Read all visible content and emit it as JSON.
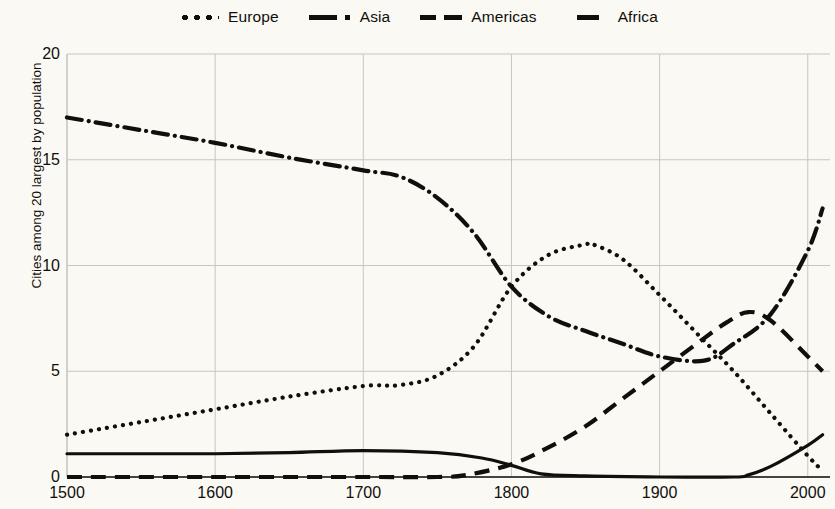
{
  "legend": {
    "position": "top-center",
    "items": [
      {
        "label": "Europe",
        "style": "dotted",
        "swatch_class": "sw-dotted"
      },
      {
        "label": "Asia",
        "style": "dashdot",
        "swatch_class": "sw-dashdot"
      },
      {
        "label": "Americas",
        "style": "dashed",
        "swatch_class": "sw-dashed"
      },
      {
        "label": "Africa",
        "style": "solid",
        "swatch_class": "sw-solid"
      }
    ]
  },
  "axes": {
    "ylabel": "Cities among 20 largest by population",
    "xlabel": "",
    "yticks": [
      0,
      5,
      10,
      15,
      20
    ],
    "xticks": [
      1500,
      1600,
      1700,
      1800,
      1900,
      2000
    ]
  },
  "colors": {
    "line": "#100f0c",
    "grid": "#c8c6bd",
    "axis": "#100f0c",
    "background": "#faf9f4"
  },
  "chart_data": {
    "type": "line",
    "title": "",
    "xlabel": "",
    "ylabel": "Cities among 20 largest by population",
    "xlim": [
      1500,
      2015
    ],
    "ylim": [
      0,
      20
    ],
    "xticks": [
      1500,
      1600,
      1700,
      1800,
      1900,
      2000
    ],
    "yticks": [
      0,
      5,
      10,
      15,
      20
    ],
    "grid": true,
    "legend_position": "top-center",
    "series": [
      {
        "name": "Europe",
        "style": "dotted",
        "x": [
          1500,
          1550,
          1600,
          1650,
          1700,
          1725,
          1750,
          1775,
          1800,
          1825,
          1850,
          1855,
          1875,
          1900,
          1925,
          1950,
          1975,
          2000,
          2010
        ],
        "y": [
          2.0,
          2.6,
          3.2,
          3.8,
          4.3,
          4.35,
          4.8,
          6.2,
          9.0,
          10.5,
          11.0,
          11.0,
          10.3,
          8.6,
          6.8,
          5.0,
          3.0,
          1.0,
          0.3
        ]
      },
      {
        "name": "Asia",
        "style": "dashdot",
        "x": [
          1500,
          1550,
          1600,
          1650,
          1700,
          1725,
          1750,
          1775,
          1800,
          1825,
          1850,
          1875,
          1900,
          1930,
          1950,
          1975,
          2000,
          2010
        ],
        "y": [
          17.0,
          16.4,
          15.8,
          15.1,
          14.5,
          14.2,
          13.2,
          11.5,
          9.0,
          7.6,
          6.9,
          6.3,
          5.7,
          5.5,
          6.3,
          7.7,
          10.7,
          12.7
        ]
      },
      {
        "name": "Americas",
        "style": "dashed",
        "x": [
          1500,
          1600,
          1700,
          1750,
          1770,
          1800,
          1825,
          1850,
          1875,
          1900,
          1925,
          1945,
          1960,
          1975,
          2000,
          2010
        ],
        "y": [
          0.0,
          0.0,
          0.0,
          0.0,
          0.1,
          0.6,
          1.4,
          2.4,
          3.7,
          5.0,
          6.3,
          7.3,
          7.8,
          7.4,
          5.7,
          5.0
        ]
      },
      {
        "name": "Africa",
        "style": "solid",
        "x": [
          1500,
          1550,
          1600,
          1650,
          1700,
          1750,
          1780,
          1800,
          1820,
          1850,
          1900,
          1950,
          1960,
          1975,
          2000,
          2010
        ],
        "y": [
          1.1,
          1.1,
          1.1,
          1.15,
          1.25,
          1.15,
          0.9,
          0.55,
          0.15,
          0.05,
          0.0,
          0.0,
          0.1,
          0.5,
          1.5,
          2.0
        ]
      }
    ]
  }
}
